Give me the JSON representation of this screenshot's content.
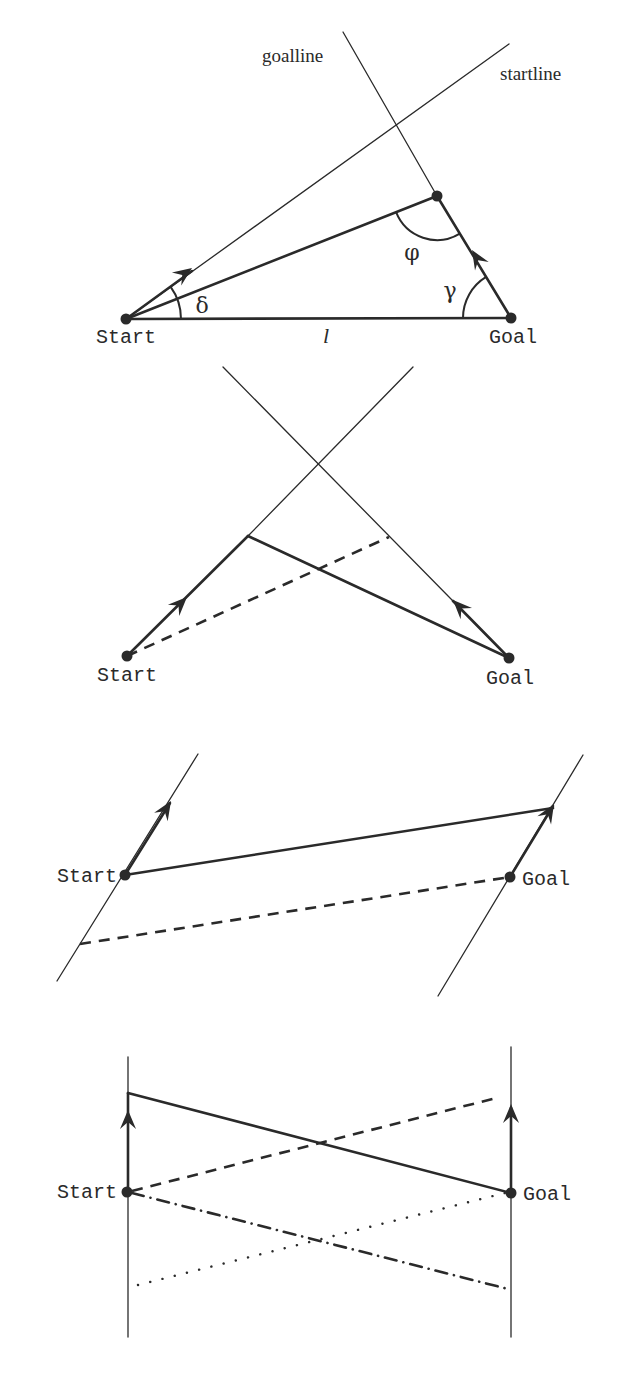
{
  "figure": {
    "ink_color": "#2a2a2a",
    "thin_width": 1.3,
    "thick_width": 2.6,
    "dot_radius": 5.5,
    "panels": [
      {
        "id": "panel-1-triangle",
        "lines": [
          {
            "name": "goalline",
            "from": [
              343,
              32
            ],
            "to": [
              437,
              196
            ],
            "style": "thin"
          },
          {
            "name": "startline",
            "from": [
              509,
              44
            ],
            "to": [
              126,
              319
            ],
            "style": "thin"
          },
          {
            "name": "start-to-apex-path",
            "from": [
              126,
              319
            ],
            "to": [
              437,
              196
            ],
            "style": "thick"
          },
          {
            "name": "start-heading-segment",
            "from": [
              126,
              319
            ],
            "to": [
              192,
              271
            ],
            "style": "thick"
          },
          {
            "name": "goal-to-apex-path",
            "from": [
              511,
              318
            ],
            "to": [
              437,
              196
            ],
            "style": "thick"
          },
          {
            "name": "baseline-l",
            "from": [
              126,
              319
            ],
            "to": [
              511,
              318
            ],
            "style": "thick"
          }
        ],
        "arrows": [
          {
            "name": "start-heading-arrow",
            "tip": [
              192,
              268
            ],
            "dir": [
              0.812,
              -0.583
            ]
          },
          {
            "name": "goal-heading-arrow",
            "tip": [
              472,
              250
            ],
            "dir": [
              -0.519,
              -0.855
            ]
          }
        ],
        "arcs": [
          {
            "name": "delta-arc",
            "cx": 126,
            "cy": 319,
            "r": 55,
            "a1": -36,
            "a2": 0
          },
          {
            "name": "gamma-arc",
            "cx": 511,
            "cy": 318,
            "r": 48,
            "a1": 180,
            "a2": 238.8
          },
          {
            "name": "phi-arc",
            "cx": 437,
            "cy": 196,
            "r": 44,
            "a1": 58.8,
            "a2": 158.4
          }
        ],
        "dots": [
          {
            "name": "start-dot",
            "at": [
              126,
              319
            ]
          },
          {
            "name": "apex-dot",
            "at": [
              437,
              196
            ]
          },
          {
            "name": "goal-dot",
            "at": [
              511,
              318
            ]
          }
        ],
        "labels": [
          {
            "name": "goalline-label",
            "text": "goalline",
            "x": 262,
            "y": 62,
            "cls": "serif",
            "anchor": "start"
          },
          {
            "name": "startline-label",
            "text": "startline",
            "x": 500,
            "y": 80,
            "cls": "serif",
            "anchor": "start"
          },
          {
            "name": "start-label",
            "text": "Start",
            "x": 96,
            "y": 343,
            "cls": "mono",
            "anchor": "start"
          },
          {
            "name": "goal-label",
            "text": "Goal",
            "x": 489,
            "y": 343,
            "cls": "mono",
            "anchor": "start"
          },
          {
            "name": "delta-label",
            "text": "δ",
            "x": 202,
            "y": 313,
            "cls": "greek",
            "anchor": "middle"
          },
          {
            "name": "gamma-label",
            "text": "γ",
            "x": 450,
            "y": 298,
            "cls": "greek",
            "anchor": "middle"
          },
          {
            "name": "phi-label",
            "text": "φ",
            "x": 412,
            "y": 260,
            "cls": "greek",
            "anchor": "middle"
          },
          {
            "name": "length-label",
            "text": "l",
            "x": 326,
            "y": 343,
            "cls": "italic",
            "anchor": "middle"
          }
        ]
      },
      {
        "id": "panel-2-crossing",
        "lines": [
          {
            "name": "goalline",
            "from": [
              223,
              367
            ],
            "to": [
              509,
              658
            ],
            "style": "thin"
          },
          {
            "name": "startline",
            "from": [
              413,
              367
            ],
            "to": [
              248,
              536
            ],
            "style": "thin"
          },
          {
            "name": "start-heading-path",
            "from": [
              127,
              656
            ],
            "to": [
              248,
              536
            ],
            "style": "thick"
          },
          {
            "name": "goal-heading-path",
            "from": [
              509,
              658
            ],
            "to": [
              453,
              601
            ],
            "style": "thick"
          },
          {
            "name": "solid-connector",
            "from": [
              248,
              536
            ],
            "to": [
              509,
              658
            ],
            "style": "thick"
          },
          {
            "name": "dashed-connector",
            "from": [
              127,
              656
            ],
            "to": [
              389,
              537
            ],
            "style": "dashed"
          }
        ],
        "arrows": [
          {
            "name": "start-heading-arrow",
            "tip": [
              187,
              597
            ],
            "dir": [
              0.707,
              -0.707
            ]
          },
          {
            "name": "goal-heading-arrow",
            "tip": [
              453,
              600
            ],
            "dir": [
              -0.7,
              -0.714
            ]
          }
        ],
        "arcs": [],
        "dots": [
          {
            "name": "start-dot",
            "at": [
              127,
              656
            ]
          },
          {
            "name": "goal-dot",
            "at": [
              509,
              658
            ]
          }
        ],
        "labels": [
          {
            "name": "start-label",
            "text": "Start",
            "x": 97,
            "y": 681,
            "cls": "mono",
            "anchor": "start"
          },
          {
            "name": "goal-label",
            "text": "Goal",
            "x": 486,
            "y": 684,
            "cls": "mono",
            "anchor": "start"
          }
        ]
      },
      {
        "id": "panel-3-parallel-slanted",
        "lines": [
          {
            "name": "startline",
            "from": [
              57,
              981
            ],
            "to": [
              198,
              754
            ],
            "style": "thin"
          },
          {
            "name": "goalline",
            "from": [
              438,
              996
            ],
            "to": [
              583,
              755
            ],
            "style": "thin"
          },
          {
            "name": "start-heading-path",
            "from": [
              125,
              875
            ],
            "to": [
              170,
              803
            ],
            "style": "thick"
          },
          {
            "name": "goal-heading-path",
            "from": [
              510,
              877
            ],
            "to": [
              553,
              806
            ],
            "style": "thick"
          },
          {
            "name": "solid-connector",
            "from": [
              125,
              875
            ],
            "to": [
              553,
              808
            ],
            "style": "thick"
          },
          {
            "name": "dashed-connector",
            "from": [
              80,
              944
            ],
            "to": [
              510,
              877
            ],
            "style": "dashed"
          }
        ],
        "arrows": [
          {
            "name": "start-heading-arrow",
            "tip": [
              171,
              801
            ],
            "dir": [
              0.531,
              -0.847
            ]
          },
          {
            "name": "goal-heading-arrow",
            "tip": [
              554,
              804
            ],
            "dir": [
              0.516,
              -0.857
            ]
          }
        ],
        "arcs": [],
        "dots": [
          {
            "name": "start-dot",
            "at": [
              125,
              875
            ]
          },
          {
            "name": "goal-dot",
            "at": [
              510,
              877
            ]
          }
        ],
        "labels": [
          {
            "name": "start-label",
            "text": "Start",
            "x": 117,
            "y": 882,
            "cls": "mono",
            "anchor": "end"
          },
          {
            "name": "goal-label",
            "text": "Goal",
            "x": 522,
            "y": 885,
            "cls": "mono",
            "anchor": "start"
          }
        ]
      },
      {
        "id": "panel-4-parallel-vertical",
        "lines": [
          {
            "name": "startline",
            "from": [
              128,
              1057
            ],
            "to": [
              128,
              1337
            ],
            "style": "thin"
          },
          {
            "name": "goalline",
            "from": [
              511,
              1047
            ],
            "to": [
              511,
              1337
            ],
            "style": "thin"
          },
          {
            "name": "start-heading-path",
            "from": [
              128,
              1192
            ],
            "to": [
              128,
              1093
            ],
            "style": "thick"
          },
          {
            "name": "goal-heading-path",
            "from": [
              511,
              1193
            ],
            "to": [
              511,
              1108
            ],
            "style": "thick"
          },
          {
            "name": "solid-connector",
            "from": [
              128,
              1093
            ],
            "to": [
              511,
              1193
            ],
            "style": "thick"
          },
          {
            "name": "dashed-connector",
            "from": [
              132,
              1191
            ],
            "to": [
              500,
              1097
            ],
            "style": "dashed"
          },
          {
            "name": "dotted-connector",
            "from": [
              138,
              1285
            ],
            "to": [
              505,
              1193
            ],
            "style": "dotted"
          },
          {
            "name": "dashdot-connector",
            "from": [
              132,
              1193
            ],
            "to": [
              508,
              1289
            ],
            "style": "dashdot"
          }
        ],
        "arrows": [
          {
            "name": "start-heading-arrow",
            "tip": [
              128,
              1110
            ],
            "dir": [
              0,
              -1
            ]
          },
          {
            "name": "goal-heading-arrow",
            "tip": [
              511,
              1104
            ],
            "dir": [
              0,
              -1
            ]
          }
        ],
        "arcs": [],
        "dots": [
          {
            "name": "start-dot",
            "at": [
              127,
              1192
            ]
          },
          {
            "name": "goal-dot",
            "at": [
              511,
              1193
            ]
          }
        ],
        "labels": [
          {
            "name": "start-label",
            "text": "Start",
            "x": 117,
            "y": 1198,
            "cls": "mono",
            "anchor": "end"
          },
          {
            "name": "goal-label",
            "text": "Goal",
            "x": 523,
            "y": 1200,
            "cls": "mono",
            "anchor": "start"
          }
        ]
      }
    ]
  }
}
